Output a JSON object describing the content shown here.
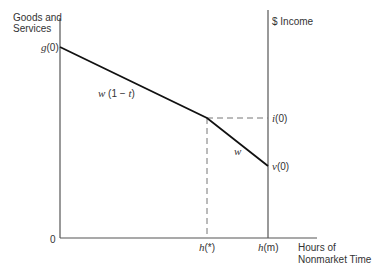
{
  "axes": {
    "y_left_label_line1": "Goods and",
    "y_left_label_line2": "Services",
    "y_right_label": "$ Income",
    "x_label_line1": "Hours of",
    "x_label_line2": "Nonmarket Time",
    "origin": "0"
  },
  "points": {
    "g0_var": "g",
    "g0_arg": "(0)",
    "i0_var": "i",
    "i0_arg": "(0)",
    "v0_var": "v",
    "v0_arg": "(0)",
    "hstar_var": "h",
    "hstar_arg": "(*)",
    "hm_var": "h",
    "hm_arg": "(m)"
  },
  "segments": {
    "upper_slope_var": "w",
    "upper_slope_rest": " (1 − ",
    "upper_slope_t": "t",
    "upper_slope_close": ")",
    "lower_slope": "w"
  },
  "colors": {
    "line": "#111111",
    "axis": "#555555",
    "dashed": "#777777"
  }
}
